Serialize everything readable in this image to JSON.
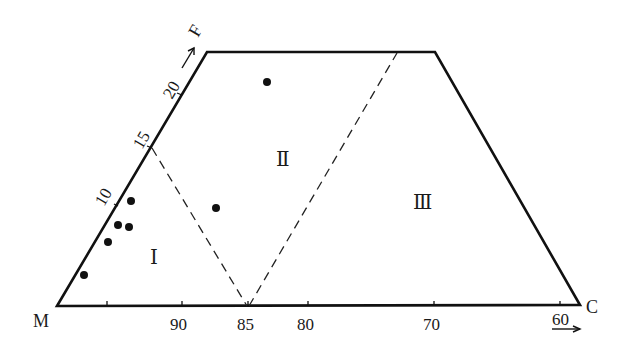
{
  "diagram": {
    "type": "ternary-trapezoid-classification",
    "vertices": {
      "M": "M",
      "C": "C",
      "F": "F"
    },
    "bottom_axis": {
      "ticks": [
        "90",
        "85",
        "80",
        "70",
        "60"
      ],
      "direction_arrow": "right"
    },
    "left_axis": {
      "ticks": [
        "10",
        "15",
        "20"
      ],
      "direction_arrow": "up-right"
    },
    "regions": {
      "r1": "Ⅰ",
      "r2": "Ⅱ",
      "r3": "Ⅲ"
    },
    "colors": {
      "line": "#111111",
      "background": "#ffffff"
    },
    "points": [
      {
        "x": 267,
        "y": 82
      },
      {
        "x": 216,
        "y": 208
      },
      {
        "x": 131,
        "y": 201
      },
      {
        "x": 118,
        "y": 225
      },
      {
        "x": 129,
        "y": 227
      },
      {
        "x": 108,
        "y": 242
      },
      {
        "x": 84,
        "y": 275
      }
    ]
  }
}
